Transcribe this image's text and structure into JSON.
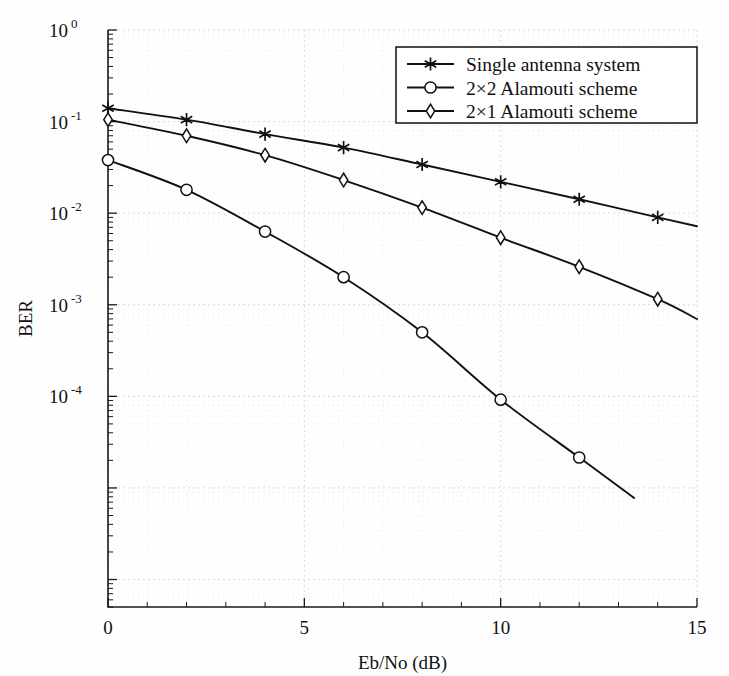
{
  "chart_data": {
    "type": "line",
    "title": "",
    "xlabel": "Eb/No (dB)",
    "ylabel": "BER",
    "xlim": [
      0,
      15
    ],
    "ylim": [
      2.2e-07,
      1.0
    ],
    "yscale": "log",
    "grid": true,
    "legend_position": "top-right",
    "x_ticks": [
      "0",
      "5",
      "10",
      "15"
    ],
    "x_tick_values": [
      0,
      5,
      10,
      15
    ],
    "x_minor_step": 1,
    "y_ticks": [
      {
        "base": "10",
        "exp": "0",
        "value": 1
      },
      {
        "base": "10",
        "exp": "-1",
        "value": 0.1
      },
      {
        "base": "10",
        "exp": "-2",
        "value": 0.01
      },
      {
        "base": "10",
        "exp": "-3",
        "value": 0.001
      },
      {
        "base": "10",
        "exp": "-4",
        "value": 0.0001
      }
    ],
    "x": [
      0,
      2,
      4,
      6,
      8,
      10,
      12,
      14,
      15
    ],
    "series": [
      {
        "name": "Single antenna system",
        "marker": "star",
        "values": [
          0.14,
          0.105,
          0.073,
          0.052,
          0.034,
          0.022,
          0.0142,
          0.009,
          0.0072
        ],
        "marker_x": [
          0,
          2,
          4,
          6,
          8,
          10,
          12,
          14
        ]
      },
      {
        "name": "2×2 Alamouti scheme",
        "marker": "circle",
        "values": [
          0.038,
          0.018,
          0.0063,
          0.002,
          0.0005,
          9.2e-05,
          2.15e-05,
          null,
          null
        ],
        "marker_x": [
          0,
          2,
          4,
          6,
          8,
          10,
          12
        ],
        "truncated_at_x": 13.4
      },
      {
        "name": "2×1 Alamouti scheme",
        "marker": "diamond",
        "values": [
          0.105,
          0.07,
          0.043,
          0.023,
          0.0115,
          0.0054,
          0.0026,
          0.00115,
          0.0007
        ],
        "marker_x": [
          0,
          2,
          4,
          6,
          8,
          10,
          12,
          14
        ]
      }
    ]
  },
  "legend": {
    "entries": [
      {
        "label": "Single antenna system",
        "marker": "star-icon"
      },
      {
        "label": "2×2 Alamouti scheme",
        "marker": "circle-icon"
      },
      {
        "label": "2×1 Alamouti scheme",
        "marker": "diamond-icon"
      }
    ]
  },
  "colors": {
    "line": "#111111",
    "axis": "#1a1a1a",
    "grid_major": "#cfcfcf",
    "grid_minor": "#e2e2e2",
    "background": "#fefefe"
  }
}
